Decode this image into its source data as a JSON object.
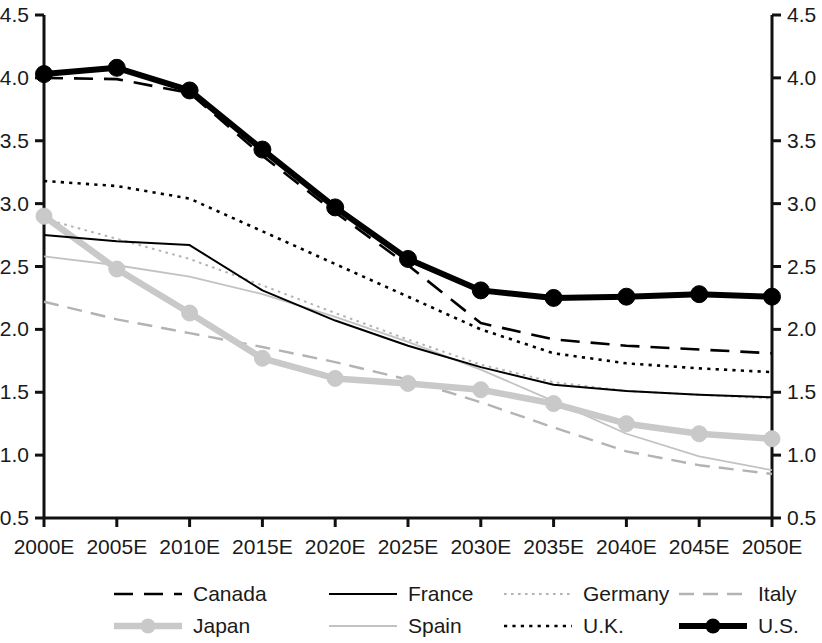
{
  "chart_data": {
    "type": "line",
    "title": "",
    "subtitle": "",
    "xlabel": "",
    "ylabel": "",
    "x": [
      "2000E",
      "2005E",
      "2010E",
      "2015E",
      "2020E",
      "2025E",
      "2030E",
      "2035E",
      "2040E",
      "2045E",
      "2050E"
    ],
    "xlim": [
      0,
      10
    ],
    "ylim": [
      0.5,
      4.5
    ],
    "ytick_labels": [
      "0.5",
      "1.0",
      "1.5",
      "2.0",
      "2.5",
      "3.0",
      "3.5",
      "4.0",
      "4.5"
    ],
    "ytick_values": [
      0.5,
      1.0,
      1.5,
      2.0,
      2.5,
      3.0,
      3.5,
      4.0,
      4.5
    ],
    "right_axis": true,
    "right_ytick_labels": [
      "0.5",
      "1.0",
      "1.5",
      "2.0",
      "2.5",
      "3.0",
      "3.5",
      "4.0",
      "4.5"
    ],
    "grid": false,
    "legend_position": "bottom",
    "series": [
      {
        "name": "Canada",
        "style": "dashed",
        "color": "#000000",
        "width": 2.6,
        "markers": false,
        "values": [
          4.0,
          3.99,
          3.88,
          3.38,
          2.93,
          2.51,
          2.05,
          1.92,
          1.87,
          1.84,
          1.81
        ]
      },
      {
        "name": "France",
        "style": "solid",
        "color": "#000000",
        "width": 2.0,
        "markers": false,
        "values": [
          2.75,
          2.7,
          2.67,
          2.31,
          2.07,
          1.87,
          1.7,
          1.56,
          1.51,
          1.48,
          1.46
        ]
      },
      {
        "name": "Germany",
        "style": "fine-dotted",
        "color": "#b3b3b3",
        "width": 2.0,
        "markers": false,
        "values": [
          2.88,
          2.72,
          2.56,
          2.35,
          2.13,
          1.92,
          1.72,
          1.58,
          1.51,
          1.48,
          1.45
        ]
      },
      {
        "name": "Italy",
        "style": "dashed",
        "color": "#b3b3b3",
        "width": 2.4,
        "markers": false,
        "values": [
          2.22,
          2.08,
          1.97,
          1.86,
          1.74,
          1.6,
          1.42,
          1.22,
          1.03,
          0.92,
          0.85
        ]
      },
      {
        "name": "Japan",
        "style": "solid-marker",
        "color": "#c9c9c9",
        "width": 6.5,
        "markers": true,
        "values": [
          2.9,
          2.48,
          2.13,
          1.77,
          1.61,
          1.57,
          1.52,
          1.41,
          1.25,
          1.17,
          1.13
        ]
      },
      {
        "name": "Spain",
        "style": "solid",
        "color": "#c2c2c2",
        "width": 1.8,
        "markers": false,
        "values": [
          2.58,
          2.51,
          2.42,
          2.28,
          2.1,
          1.9,
          1.68,
          1.43,
          1.17,
          0.99,
          0.88
        ]
      },
      {
        "name": "U.K.",
        "style": "dotted",
        "color": "#000000",
        "width": 2.6,
        "markers": false,
        "values": [
          3.18,
          3.14,
          3.04,
          2.78,
          2.52,
          2.26,
          2.0,
          1.81,
          1.73,
          1.69,
          1.66
        ]
      },
      {
        "name": "U.S.",
        "style": "solid-marker",
        "color": "#000000",
        "width": 6.0,
        "markers": true,
        "values": [
          4.03,
          4.08,
          3.9,
          3.43,
          2.97,
          2.56,
          2.31,
          2.25,
          2.26,
          2.28,
          2.26
        ]
      }
    ]
  },
  "legend": {
    "items": [
      {
        "label": "Canada"
      },
      {
        "label": "France"
      },
      {
        "label": "Germany"
      },
      {
        "label": "Italy"
      },
      {
        "label": "Japan"
      },
      {
        "label": "Spain"
      },
      {
        "label": "U.K."
      },
      {
        "label": "U.S."
      }
    ]
  },
  "axes": {
    "left_labels": [
      "4.5",
      "4.0",
      "3.5",
      "3.0",
      "2.5",
      "2.0",
      "1.5",
      "1.0",
      "0.5"
    ],
    "right_labels": [
      "4.5",
      "4.0",
      "3.5",
      "3.0",
      "2.5",
      "2.0",
      "1.5",
      "1.0",
      "0.5"
    ],
    "x_labels": [
      "2000E",
      "2005E",
      "2010E",
      "2015E",
      "2020E",
      "2025E",
      "2030E",
      "2035E",
      "2040E",
      "2045E",
      "2050E"
    ]
  }
}
